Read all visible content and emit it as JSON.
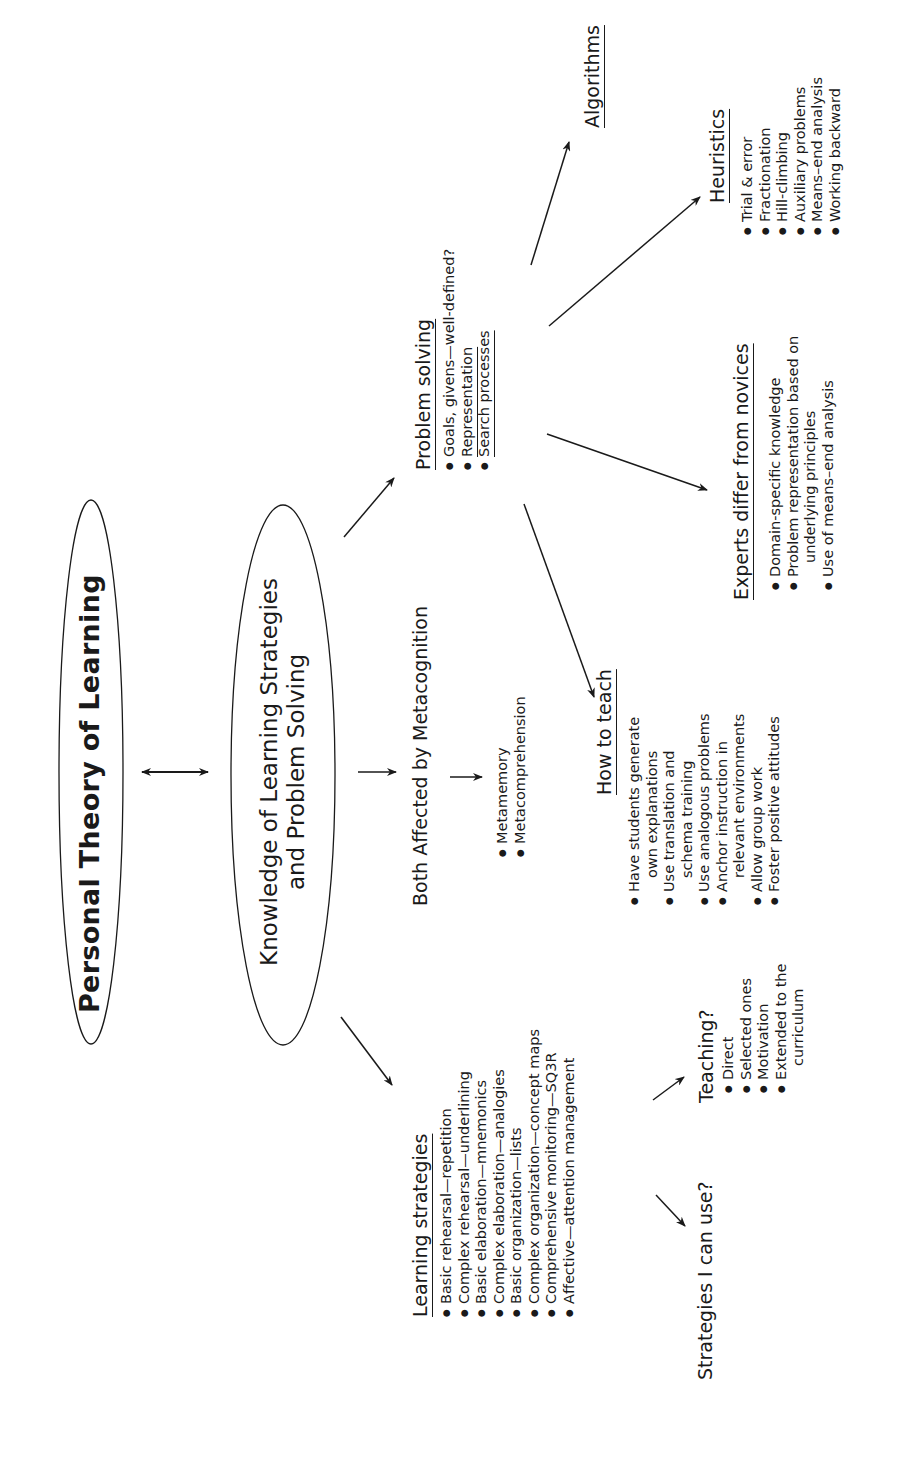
{
  "title": "Personal Theory of Learning",
  "center_node": {
    "line1": "Knowledge of Learning Strategies",
    "line2": "and Problem Solving"
  },
  "metacognition": {
    "label": "Both Affected by Metacognition",
    "items": [
      "Metamemory",
      "Metacomprehension"
    ]
  },
  "learning_strategies": {
    "heading": "Learning strategies",
    "items": [
      "Basic rehearsal—repetition",
      "Complex rehearsal—underlining",
      "Basic elaboration—mnemonics",
      "Complex elaboration—analogies",
      "Basic organization—lists",
      "Complex organization—concept maps",
      "Comprehensive monitoring—SQ3R",
      "Affective—attention management"
    ]
  },
  "strategies_i_can_use": {
    "label": "Strategies I can use?"
  },
  "teaching": {
    "label": "Teaching?",
    "items": [
      "Direct",
      "Selected ones",
      "Motivation",
      "Extended to the"
    ],
    "item4_cont": "curriculum"
  },
  "problem_solving": {
    "heading": "Problem solving",
    "items": [
      "Goals, givens—well-defined?",
      "Representation",
      "Search processes"
    ]
  },
  "how_to_teach": {
    "heading": "How to teach",
    "items": [
      {
        "text": "Have students generate",
        "cont": "own explanations"
      },
      {
        "text": "Use translation and",
        "cont": "schema training"
      },
      {
        "text": "Use analogous problems",
        "cont": ""
      },
      {
        "text": "Anchor instruction in",
        "cont": "relevant environments"
      },
      {
        "text": "Allow group work",
        "cont": ""
      },
      {
        "text": "Foster positive attitudes",
        "cont": ""
      }
    ]
  },
  "experts": {
    "heading": "Experts differ from novices",
    "items": [
      {
        "text": "Domain-specific knowledge",
        "cont": ""
      },
      {
        "text": "Problem representation based on",
        "cont": "underlying principles"
      },
      {
        "text": "Use of means–end analysis",
        "cont": ""
      }
    ]
  },
  "heuristics": {
    "heading": "Heuristics",
    "items": [
      "Trial & error",
      "Fractionation",
      "Hill-climbing",
      "Auxiliary problems",
      "Means–end analysis",
      "Working backward"
    ]
  },
  "algorithms": {
    "heading": "Algorithms"
  },
  "colors": {
    "ink": "#1a1a1a",
    "background": "#ffffff"
  }
}
